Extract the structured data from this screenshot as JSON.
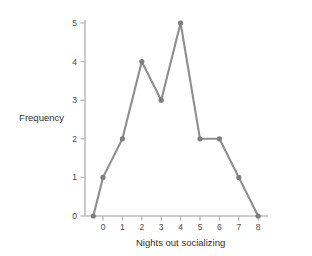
{
  "chart_data": {
    "type": "line",
    "title": "",
    "subtitle": "",
    "xlabel": "Nights out socializing",
    "ylabel": "Frequency",
    "x": [
      0,
      1,
      2,
      3,
      4,
      5,
      6,
      7,
      8
    ],
    "values": [
      1,
      2,
      4,
      3,
      5,
      2,
      2,
      1,
      0
    ],
    "series": [
      {
        "name": "Frequency",
        "values": [
          1,
          2,
          4,
          3,
          5,
          2,
          2,
          1,
          0
        ]
      }
    ],
    "anchor_point": {
      "x": -0.5,
      "y": 0,
      "note": "polygon closed down to the horizontal axis left of x=0"
    },
    "xtick_labels": [
      "0",
      "1",
      "2",
      "3",
      "4",
      "5",
      "6",
      "7",
      "8"
    ],
    "ytick_labels": [
      "0",
      "1",
      "2",
      "3",
      "4",
      "5"
    ],
    "xticks": [
      0,
      1,
      2,
      3,
      4,
      5,
      6,
      7,
      8
    ],
    "yticks": [
      0,
      1,
      2,
      3,
      4,
      5
    ],
    "xlim": [
      -0.75,
      8.35
    ],
    "ylim": [
      0,
      5.35
    ],
    "grid": false,
    "legend": false,
    "legend_position": "none",
    "colors": {
      "line": "#8e8e8e",
      "marker": "#7e7e7e",
      "axis": "#bdbdbd",
      "tick_text": "#4a4a4a",
      "label_text": "#2f2f2f",
      "background": "#ffffff"
    },
    "marker": "circle",
    "marker_size": 2.6,
    "line_width": 2.1
  }
}
